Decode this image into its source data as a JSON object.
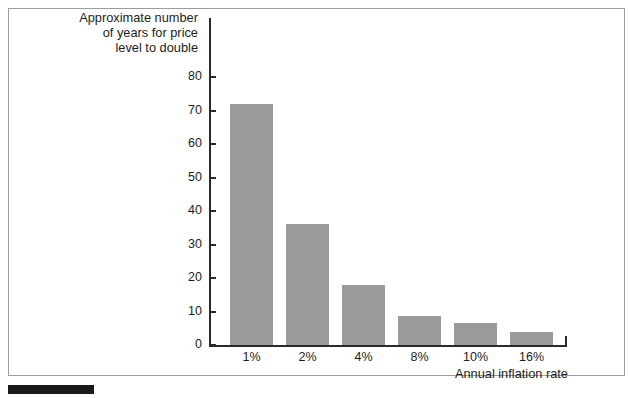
{
  "chart_data": {
    "type": "bar",
    "title": "",
    "categories": [
      "1%",
      "2%",
      "4%",
      "8%",
      "10%",
      "16%"
    ],
    "values": [
      72,
      36,
      18,
      8.7,
      6.6,
      3.8
    ],
    "xlabel": "Annual inflation rate",
    "ylabel": "Approximate number\nof years for price\nlevel to double",
    "ylim": [
      0,
      80
    ],
    "yticks": [
      0,
      10,
      20,
      30,
      40,
      50,
      60,
      70,
      80
    ],
    "ytick_labels": [
      "0",
      "10",
      "20",
      "30",
      "40",
      "50",
      "60",
      "70",
      "80"
    ],
    "grid": false,
    "legend": null,
    "bar_color": "#9a9a9a",
    "axis_color": "#2b2b2b",
    "frame_color": "#9c9c9c",
    "marker_color": "#1a1a1a"
  },
  "figure": {
    "background": "#ffffff"
  }
}
